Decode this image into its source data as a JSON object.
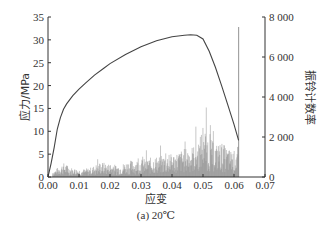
{
  "chart_data": {
    "type": "line",
    "caption": "(a) 20℃",
    "xlabel": "应变",
    "ylabel": "应力/MPa",
    "y2label": "振铃计数率",
    "xlim": [
      0,
      0.07
    ],
    "ylim": [
      0,
      35
    ],
    "y2lim": [
      0,
      8000
    ],
    "xticks": [
      "0.00",
      "0.01",
      "0.02",
      "0.03",
      "0.04",
      "0.05",
      "0.06",
      "0.07"
    ],
    "yticks": [
      "0",
      "5",
      "10",
      "15",
      "20",
      "25",
      "30",
      "35"
    ],
    "y2ticks": [
      "0",
      "2 000",
      "4 000",
      "6 000",
      "8 000"
    ],
    "grid": false,
    "series": [
      {
        "name": "应力",
        "axis": "left",
        "color": "#444444",
        "x": [
          0.0,
          0.001,
          0.002,
          0.003,
          0.004,
          0.005,
          0.006,
          0.008,
          0.01,
          0.012,
          0.015,
          0.018,
          0.02,
          0.025,
          0.03,
          0.035,
          0.04,
          0.044,
          0.046,
          0.048,
          0.05,
          0.052,
          0.054,
          0.056,
          0.058,
          0.06,
          0.0615
        ],
        "y": [
          0.0,
          3.0,
          6.5,
          10.5,
          13.0,
          14.8,
          16.0,
          17.8,
          19.2,
          20.5,
          22.3,
          23.8,
          24.8,
          26.8,
          28.5,
          29.8,
          30.7,
          31.0,
          31.1,
          31.0,
          30.2,
          27.5,
          24.0,
          20.0,
          15.8,
          11.5,
          8.0
        ]
      },
      {
        "name": "振铃计数率",
        "axis": "right",
        "color": "#888888",
        "type": "bar",
        "x": [
          0.002,
          0.005,
          0.008,
          0.011,
          0.014,
          0.017,
          0.02,
          0.023,
          0.026,
          0.029,
          0.032,
          0.035,
          0.038,
          0.041,
          0.044,
          0.047,
          0.049,
          0.05,
          0.052,
          0.054,
          0.056,
          0.058,
          0.06,
          0.061
        ],
        "y": [
          300,
          650,
          400,
          350,
          450,
          700,
          600,
          550,
          750,
          800,
          850,
          950,
          1000,
          1100,
          1300,
          1450,
          1800,
          2500,
          1800,
          1500,
          1600,
          1300,
          1200,
          1400
        ]
      }
    ],
    "annotations": [
      {
        "type": "vline",
        "x": 0.0615,
        "color": "#888888"
      }
    ]
  }
}
